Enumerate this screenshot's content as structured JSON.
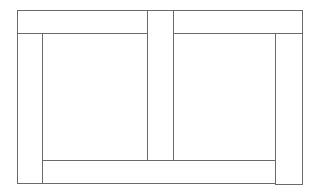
{
  "diagram": {
    "stroke_color": "#6a6a6a",
    "background_color": "#ffffff",
    "regions": [
      {
        "id": "top-left-bar"
      },
      {
        "id": "center-vertical-strip"
      },
      {
        "id": "top-right-bar"
      },
      {
        "id": "left-strip"
      },
      {
        "id": "left-inner-rect"
      },
      {
        "id": "right-inner-rect"
      },
      {
        "id": "right-strip"
      },
      {
        "id": "bottom-bar"
      }
    ]
  }
}
